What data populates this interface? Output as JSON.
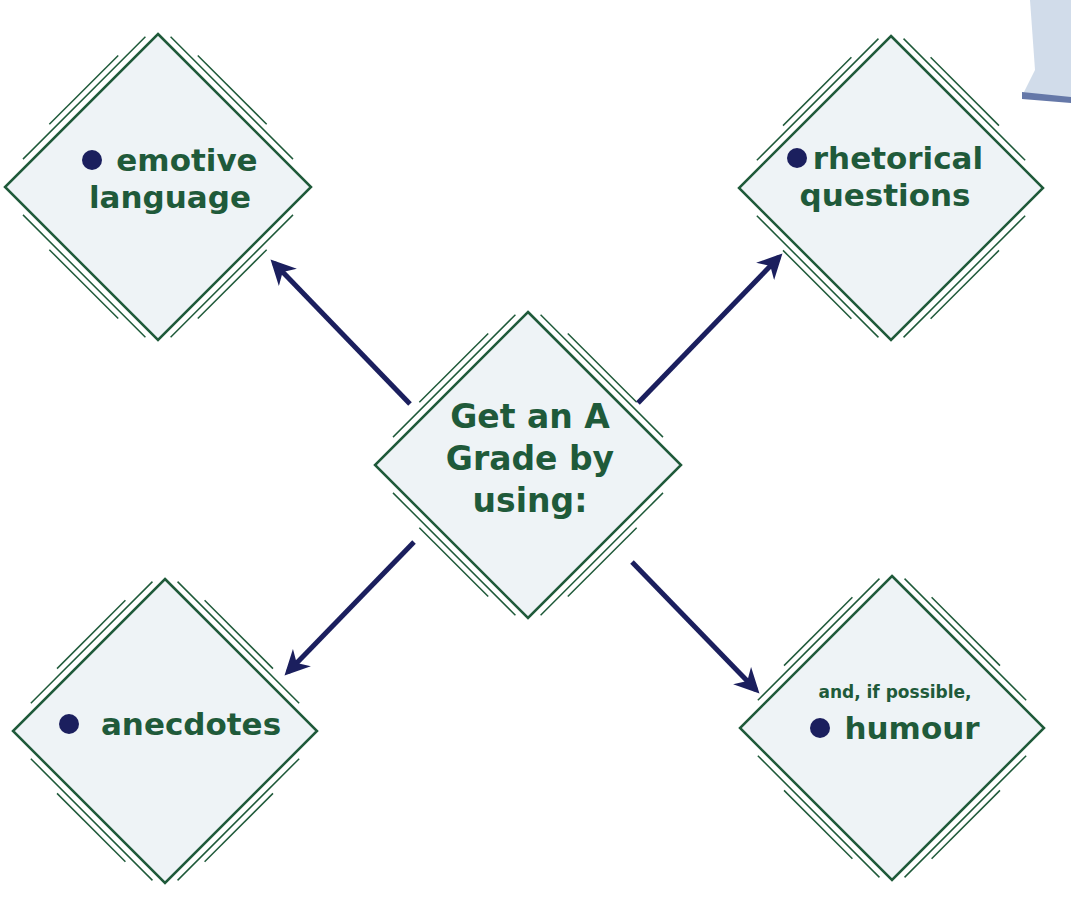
{
  "colors": {
    "diamond_fill": "#eef3f6",
    "diamond_stroke": "#1f5a3a",
    "text": "#1f5a3a",
    "arrow": "#1b1f5e",
    "bullet": "#1b1f5e",
    "corner_shape": "#b9c9dd"
  },
  "center": {
    "lines": [
      "Get an A",
      "Grade by",
      "using:"
    ]
  },
  "nodes": [
    {
      "id": "top-left",
      "bullet": true,
      "lines": [
        "emotive",
        "language"
      ]
    },
    {
      "id": "top-right",
      "bullet": true,
      "lines": [
        "rhetorical",
        "questions"
      ]
    },
    {
      "id": "bottom-left",
      "bullet": true,
      "lines": [
        "anecdotes"
      ]
    },
    {
      "id": "bottom-right",
      "bullet": true,
      "prefix": "and, if possible,",
      "lines": [
        "humour"
      ]
    }
  ],
  "edges": [
    {
      "from": "center",
      "to": "top-left"
    },
    {
      "from": "center",
      "to": "top-right"
    },
    {
      "from": "center",
      "to": "bottom-left"
    },
    {
      "from": "center",
      "to": "bottom-right"
    }
  ]
}
